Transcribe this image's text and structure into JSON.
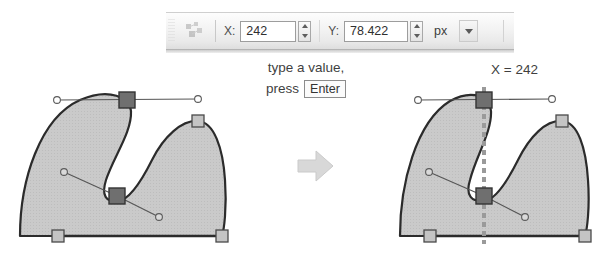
{
  "toolbar": {
    "grip_icon": "drag-grip",
    "node_tool_icon": "node-editor-icon",
    "x_label": "X:",
    "x_value": "242",
    "y_label": "Y:",
    "y_value": "78.422",
    "unit_value": "px",
    "unit_options": [
      "px",
      "pt",
      "mm",
      "cm",
      "in",
      "%"
    ],
    "spinner_up_icon": "spinner-up-arrow-icon",
    "spinner_down_icon": "spinner-down-arrow-icon",
    "dropdown_icon": "chevron-down-icon"
  },
  "caption": {
    "line1": "type a value,",
    "line2_prefix": "press",
    "key_label": "Enter"
  },
  "result_label": "X = 242",
  "arrow_icon": "right-arrow-icon",
  "illustrations": {
    "before": {
      "name": "shape-before",
      "selected_node_count": 2,
      "unselected_node_count": 3,
      "guide_visible": false
    },
    "after": {
      "name": "shape-after",
      "selected_node_count": 2,
      "unselected_node_count": 3,
      "guide_visible": true,
      "guide_x_value": "242"
    }
  },
  "colors": {
    "shape_fill": "#c8c8c8",
    "shape_stroke": "#2f2f2f",
    "node_selected": "#6f6f6f",
    "node_unselected": "#bdbdbd",
    "node_border": "#4a4a4a",
    "handle_line": "#555555",
    "guide_line": "#9a9a9a",
    "text": "#3f3f3f"
  }
}
